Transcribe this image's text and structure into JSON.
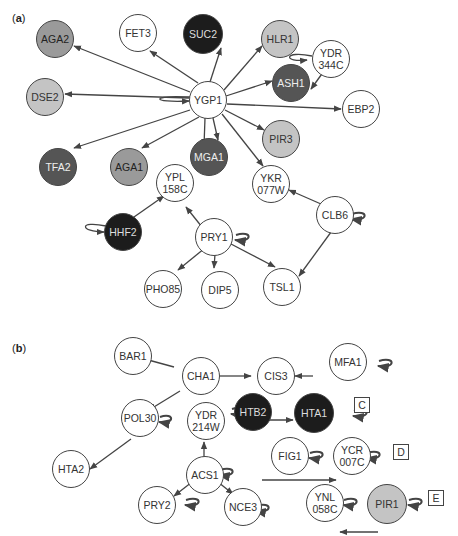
{
  "panels": {
    "a": {
      "label": "a"
    },
    "b": {
      "label": "b"
    }
  },
  "nodes": {
    "AGA2": "AGA2",
    "FET3": "FET3",
    "SUC2": "SUC2",
    "HLR1": "HLR1",
    "DSE2": "DSE2",
    "YGP1": "YGP1",
    "ASH1": "ASH1",
    "YDR344C": "YDR\n344C",
    "EBP2": "EBP2",
    "TFA2": "TFA2",
    "AGA1": "AGA1",
    "MGA1": "MGA1",
    "PIR3": "PIR3",
    "YPL158C": "YPL\n158C",
    "YKR077W": "YKR\n077W",
    "HHF2": "HHF2",
    "PRY1": "PRY1",
    "CLB6": "CLB6",
    "PHO85": "PHO85",
    "DIP5": "DIP5",
    "TSL1": "TSL1",
    "BAR1": "BAR1",
    "CHA1": "CHA1",
    "CIS3": "CIS3",
    "MFA1": "MFA1",
    "POL30": "POL30",
    "YDR214W": "YDR\n214W",
    "HTB2": "HTB2",
    "HTA1": "HTA1",
    "HTA2": "HTA2",
    "ACS1": "ACS1",
    "FIG1": "FIG1",
    "YCR007C": "YCR\n007C",
    "PRY2": "PRY2",
    "NCE3": "NCE3",
    "YNL058C": "YNL\n058C",
    "PIR1": "PIR1"
  },
  "boxes": {
    "C": "C",
    "D": "D",
    "E": "E"
  },
  "colors": {
    "white": "#ffffff",
    "light_gray": "#c4c4c4",
    "mid_gray": "#9a9a9a",
    "dark_gray": "#555555",
    "black": "#1c1c1c",
    "edge": "#444444"
  }
}
